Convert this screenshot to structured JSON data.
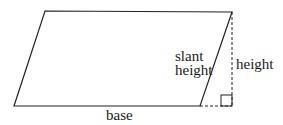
{
  "diagram": {
    "type": "parallelogram",
    "labels": {
      "base": "base",
      "slant_height_line1": "slant",
      "slant_height_line2": "height",
      "height": "height"
    },
    "colors": {
      "stroke": "#222222",
      "background": "#ffffff"
    },
    "elements": [
      "parallelogram outline",
      "dashed vertical height line",
      "dashed base extension",
      "right-angle marker"
    ]
  }
}
